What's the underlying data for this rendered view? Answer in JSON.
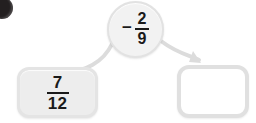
{
  "page": {
    "background_color": "#ffffff",
    "width": 256,
    "height": 123
  },
  "bullet": {
    "name": "problem-bullet",
    "color": "#231f20",
    "label": ""
  },
  "operator_node": {
    "sign": "−",
    "fraction": {
      "numerator": "2",
      "denominator": "9"
    },
    "expression": "− 2/9",
    "fill_color": "#f2f2f2",
    "border_color": "#e2e2e2"
  },
  "left_box": {
    "fraction": {
      "numerator": "7",
      "denominator": "12"
    },
    "expression": "7/12",
    "fill_color": "#ededed",
    "border_color": "#e4e4e4"
  },
  "right_box": {
    "value": "",
    "placeholder": "",
    "fill_color": "#ffffff",
    "border_color": "#e0e0e0"
  },
  "connectors": {
    "color": "#dcdcdc",
    "left": {
      "name": "curve-to-left-box",
      "has_arrowhead": false
    },
    "right": {
      "name": "arrow-to-right-box",
      "has_arrowhead": true
    }
  }
}
